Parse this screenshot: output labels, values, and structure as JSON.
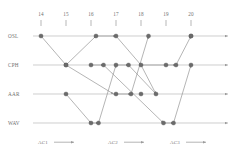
{
  "chart_data": {
    "type": "scatter",
    "title": "",
    "xlabel": "",
    "ylabel": "",
    "grid": false,
    "legend_position": "bottom",
    "x_ticks": [
      "14",
      "15",
      "16",
      "17",
      "18",
      "19",
      "20"
    ],
    "x_tick_values": [
      14,
      15,
      16,
      17,
      18,
      19,
      20
    ],
    "xlim": [
      13.6,
      20.5
    ],
    "categories": [
      "OSL",
      "CPH",
      "AAR",
      "WAV"
    ],
    "y_axis_labels": [
      "OSL",
      "CPH",
      "AAR",
      "WAV"
    ],
    "legend": [
      "AC1",
      "AC2",
      "AC3"
    ],
    "series": [
      {
        "name": "AC1",
        "nodes": [
          {
            "x": 14.0,
            "y": "OSL"
          },
          {
            "x": 15.0,
            "y": "CPH"
          },
          {
            "x": 16.0,
            "y": "WAV"
          },
          {
            "x": 16.3,
            "y": "WAV"
          },
          {
            "x": 17.0,
            "y": "CPH"
          },
          {
            "x": 17.5,
            "y": "CPH"
          },
          {
            "x": 18.0,
            "y": "AAR"
          },
          {
            "x": 19.0,
            "y": "CPH"
          },
          {
            "x": 19.4,
            "y": "CPH"
          },
          {
            "x": 20.0,
            "y": "OSL"
          }
        ]
      },
      {
        "name": "AC2",
        "nodes": [
          {
            "x": 15.0,
            "y": "AAR"
          },
          {
            "x": 16.0,
            "y": "CPH"
          },
          {
            "x": 16.5,
            "y": "CPH"
          },
          {
            "x": 17.0,
            "y": "AAR"
          },
          {
            "x": 17.6,
            "y": "AAR"
          },
          {
            "x": 18.3,
            "y": "OSL"
          },
          {
            "x": 18.9,
            "y": "WAV"
          },
          {
            "x": 19.3,
            "y": "WAV"
          },
          {
            "x": 20.0,
            "y": "CPH"
          }
        ]
      },
      {
        "name": "AC3",
        "nodes": [
          {
            "x": 15.0,
            "y": "CPH"
          },
          {
            "x": 16.2,
            "y": "OSL"
          },
          {
            "x": 17.0,
            "y": "OSL"
          },
          {
            "x": 18.0,
            "y": "CPH"
          },
          {
            "x": 18.6,
            "y": "AAR"
          },
          {
            "x": 20.0,
            "y": "OSL"
          }
        ]
      }
    ],
    "edges": [
      {
        "from": [
          14.0,
          "OSL"
        ],
        "to": [
          15.0,
          "CPH"
        ],
        "arrow": true
      },
      {
        "from": [
          15.0,
          "CPH"
        ],
        "to": [
          16.2,
          "OSL"
        ],
        "arrow": true
      },
      {
        "from": [
          16.2,
          "OSL"
        ],
        "to": [
          17.0,
          "OSL"
        ],
        "arrow": true
      },
      {
        "from": [
          17.0,
          "OSL"
        ],
        "to": [
          18.0,
          "CPH"
        ],
        "arrow": true
      },
      {
        "from": [
          18.0,
          "CPH"
        ],
        "to": [
          18.6,
          "AAR"
        ],
        "arrow": true
      },
      {
        "from": [
          15.0,
          "AAR"
        ],
        "to": [
          16.0,
          "WAV"
        ],
        "arrow": true
      },
      {
        "from": [
          16.0,
          "WAV"
        ],
        "to": [
          16.3,
          "WAV"
        ],
        "arrow": true
      },
      {
        "from": [
          16.3,
          "WAV"
        ],
        "to": [
          17.0,
          "CPH"
        ],
        "arrow": true
      },
      {
        "from": [
          17.0,
          "CPH"
        ],
        "to": [
          17.5,
          "CPH"
        ],
        "arrow": true
      },
      {
        "from": [
          15.0,
          "CPH"
        ],
        "to": [
          16.9,
          "AAR"
        ],
        "arrow": true
      },
      {
        "from": [
          16.9,
          "AAR"
        ],
        "to": [
          17.6,
          "AAR"
        ],
        "arrow": true
      },
      {
        "from": [
          17.6,
          "AAR"
        ],
        "to": [
          18.3,
          "OSL"
        ],
        "arrow": true
      },
      {
        "from": [
          16.0,
          "CPH"
        ],
        "to": [
          16.5,
          "CPH"
        ],
        "arrow": true
      },
      {
        "from": [
          16.5,
          "CPH"
        ],
        "to": [
          18.9,
          "WAV"
        ],
        "arrow": true
      },
      {
        "from": [
          18.9,
          "WAV"
        ],
        "to": [
          19.3,
          "WAV"
        ],
        "arrow": true
      },
      {
        "from": [
          19.3,
          "WAV"
        ],
        "to": [
          20.0,
          "CPH"
        ],
        "arrow": true
      },
      {
        "from": [
          17.5,
          "CPH"
        ],
        "to": [
          18.6,
          "AAR"
        ],
        "arrow": true
      },
      {
        "from": [
          18.0,
          "CPH"
        ],
        "to": [
          19.4,
          "CPH"
        ],
        "arrow": true
      },
      {
        "from": [
          19.4,
          "CPH"
        ],
        "to": [
          20.0,
          "OSL"
        ],
        "arrow": true
      }
    ]
  },
  "axis": {
    "row_labels": [
      "OSL",
      "CPH",
      "AAR",
      "WAV"
    ],
    "tick_labels": [
      "14",
      "15",
      "16",
      "17",
      "18",
      "19",
      "20"
    ]
  },
  "legend": {
    "items": [
      {
        "label": "AC1"
      },
      {
        "label": "AC2"
      },
      {
        "label": "AC3"
      }
    ]
  }
}
